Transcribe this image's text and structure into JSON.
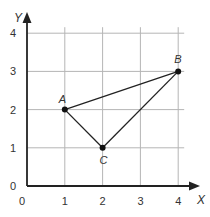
{
  "chart_data": {
    "type": "scatter",
    "title": "",
    "xlabel": "X",
    "ylabel": "Y",
    "xlim": [
      0,
      4
    ],
    "ylim": [
      0,
      4
    ],
    "grid": true,
    "x_ticks": [
      "0",
      "1",
      "2",
      "3",
      "4"
    ],
    "y_ticks": [
      "0",
      "1",
      "2",
      "3",
      "4"
    ],
    "points": [
      {
        "label": "A",
        "x": 1,
        "y": 2
      },
      {
        "label": "B",
        "x": 4,
        "y": 3
      },
      {
        "label": "C",
        "x": 2,
        "y": 1
      }
    ],
    "segments": [
      [
        "A",
        "B"
      ],
      [
        "B",
        "C"
      ],
      [
        "C",
        "A"
      ]
    ],
    "annotations": [
      "Triangle ABC"
    ]
  },
  "colors": {
    "grid": "#b5b5b5",
    "axis": "#222222",
    "point": "#111111",
    "text": "#333333"
  }
}
